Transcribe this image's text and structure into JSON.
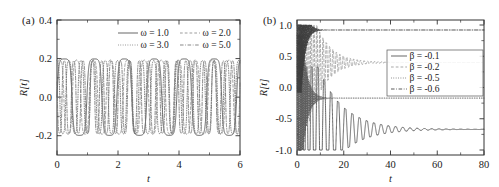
{
  "figure": {
    "background": "#ffffff",
    "panels": [
      "a",
      "b"
    ]
  },
  "panel_a": {
    "label": "(a)",
    "xlabel": "t",
    "ylabel": "R[t]",
    "xticklabels": [
      "0",
      "2",
      "4",
      "6"
    ],
    "yticklabels": [
      "0.4",
      "0.2",
      "0.0",
      "-0.2"
    ],
    "legend": [
      {
        "label": "ω = 1.0",
        "style": "solid"
      },
      {
        "label": "ω = 2.0",
        "style": "dashed"
      },
      {
        "label": "ω = 3.0",
        "style": "dotted"
      },
      {
        "label": "ω = 5.0",
        "style": "dashdot"
      }
    ]
  },
  "panel_b": {
    "label": "(b)",
    "xlabel": "t",
    "ylabel": "R[t]",
    "xticklabels": [
      "0",
      "20",
      "40",
      "60",
      "80"
    ],
    "yticklabels": [
      "1.0",
      "0.5",
      "0.0",
      "-0.5",
      "-1.0"
    ],
    "legend": [
      {
        "label": "β = -0.1",
        "style": "solid"
      },
      {
        "label": "β = -0.2",
        "style": "dashed"
      },
      {
        "label": "β = -0.5",
        "style": "dotted"
      },
      {
        "label": "β = -0.6",
        "style": "dashdot"
      }
    ]
  },
  "chart_data": [
    {
      "type": "line",
      "panel": "a",
      "title": "",
      "xlabel": "t",
      "ylabel": "R[t]",
      "xlim": [
        0,
        6
      ],
      "ylim": [
        -0.3,
        0.4
      ],
      "xticks": [
        0,
        2,
        4,
        6
      ],
      "xticks_minor": [
        1,
        3,
        5
      ],
      "yticks": [
        0.4,
        0.2,
        0.0,
        -0.2
      ],
      "yticks_minor": [
        0.3,
        0.1,
        -0.1
      ],
      "grid": false,
      "legend_position": "top-right-inside",
      "series": [
        {
          "name": "ω = 1.0",
          "style": "solid",
          "color": "#4d4d4d",
          "model": "clipped_sine",
          "amplitude": 0.205,
          "omega": 1.0,
          "freq_scale": 6.4,
          "phase": 0.0,
          "clip": 0.2,
          "sharpness": 1.9
        },
        {
          "name": "ω = 2.0",
          "style": "dashed",
          "color": "#8c8c8c",
          "model": "clipped_sine",
          "amplitude": 0.215,
          "omega": 2.0,
          "freq_scale": 11.3,
          "phase": 0.6,
          "clip": 0.2,
          "sharpness": 1.35
        },
        {
          "name": "ω = 3.0",
          "style": "dotted",
          "color": "#666666",
          "model": "clipped_sine",
          "amplitude": 0.215,
          "omega": 3.0,
          "freq_scale": 15.8,
          "phase": 1.7,
          "clip": 0.2,
          "sharpness": 1.25
        },
        {
          "name": "ω = 5.0",
          "style": "dashdot",
          "color": "#737373",
          "model": "clipped_sine",
          "amplitude": 0.212,
          "omega": 5.0,
          "freq_scale": 20.5,
          "phase": 2.9,
          "clip": 0.2,
          "sharpness": 1.2
        }
      ]
    },
    {
      "type": "line",
      "panel": "b",
      "title": "",
      "xlabel": "t",
      "ylabel": "R[t]",
      "xlim": [
        0,
        80
      ],
      "ylim": [
        -1.08,
        1.08
      ],
      "xticks": [
        0,
        20,
        40,
        60,
        80
      ],
      "xticks_minor": [
        10,
        30,
        50,
        70
      ],
      "yticks": [
        1.0,
        0.5,
        0.0,
        -0.5,
        -1.0
      ],
      "yticks_minor": [
        0.75,
        0.25,
        -0.25,
        -0.75
      ],
      "grid": false,
      "legend_position": "right-inside",
      "series": [
        {
          "name": "β = -0.1",
          "style": "solid",
          "color": "#4d4d4d",
          "model": "damped_osc",
          "amplitude": 1.0,
          "asymptote": -0.67,
          "beta": -0.1,
          "chirp_rate": 0.145,
          "decay_start": 9.0,
          "decay_tau": 10.5
        },
        {
          "name": "β = -0.2",
          "style": "dashed",
          "color": "#999999",
          "model": "damped_osc",
          "amplitude": 1.0,
          "asymptote": 0.4,
          "beta": -0.2,
          "chirp_rate": 0.3,
          "decay_start": 5.0,
          "decay_tau": 6.5
        },
        {
          "name": "β = -0.5",
          "style": "dotted",
          "color": "#5a5a5a",
          "model": "damped_osc",
          "amplitude": 1.0,
          "asymptote": -0.17,
          "beta": -0.5,
          "chirp_rate": 0.85,
          "decay_start": 2.2,
          "decay_tau": 2.2
        },
        {
          "name": "β = -0.6",
          "style": "dashdot",
          "color": "#3f3f3f",
          "model": "damped_osc",
          "amplitude": 1.0,
          "asymptote": 0.92,
          "beta": -0.6,
          "chirp_rate": 1.15,
          "decay_start": 1.8,
          "decay_tau": 1.7
        }
      ]
    }
  ]
}
